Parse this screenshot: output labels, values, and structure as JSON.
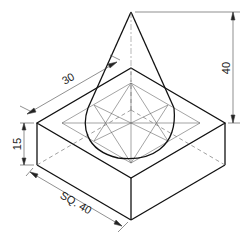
{
  "figure": {
    "dimensions": {
      "cone_slant": "30",
      "cone_height": "40",
      "block_height": "15",
      "block_side": "SQ. 40"
    }
  },
  "colors": {
    "line": "#111111",
    "thin": "#555555",
    "background": "#ffffff"
  }
}
